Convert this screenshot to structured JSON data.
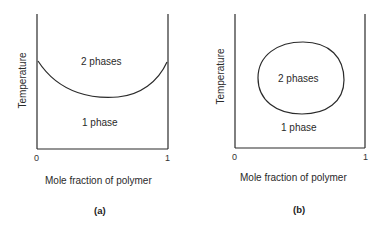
{
  "panels": [
    {
      "id": "a",
      "caption": "(a)",
      "y_axis_label": "Temperature",
      "x_axis_label": "Mole fraction of polymer",
      "x_ticks": [
        "0",
        "1"
      ],
      "region_upper": "2 phases",
      "region_lower": "1 phase",
      "curve_type": "upper-open U-shaped miscibility boundary (lower critical solution)"
    },
    {
      "id": "b",
      "caption": "(b)",
      "y_axis_label": "Temperature",
      "x_axis_label": "Mole fraction of polymer",
      "x_ticks": [
        "0",
        "1"
      ],
      "region_inner": "2 phases",
      "region_outer": "1 phase",
      "curve_type": "closed-loop miscibility gap"
    }
  ],
  "colors": {
    "line": "#2b2b2b",
    "background": "#ffffff"
  }
}
